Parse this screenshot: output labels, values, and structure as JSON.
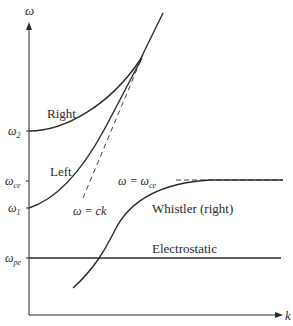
{
  "diagram": {
    "type": "dispersion-relation",
    "axes": {
      "y_label": "ω",
      "x_label": "k"
    },
    "y_ticks": [
      {
        "label": "ω",
        "sub": "2",
        "y": 131
      },
      {
        "label": "ω",
        "sub": "ce",
        "y": 181
      },
      {
        "label": "ω",
        "sub": "1",
        "y": 208
      },
      {
        "label": "ω",
        "sub": "pe",
        "y": 258
      }
    ],
    "curves": [
      {
        "name": "Right",
        "label": "Right"
      },
      {
        "name": "Left",
        "label": "Left"
      },
      {
        "name": "light-line",
        "label": "ω = ck"
      },
      {
        "name": "Whistler",
        "label": "Whistler (right)"
      },
      {
        "name": "Electrostatic",
        "label": "Electrostatic"
      }
    ],
    "asymptote_label": "ω = ω",
    "asymptote_sub": "ce",
    "colors": {
      "line": "#2b2b2b",
      "background": "#ffffff"
    }
  }
}
